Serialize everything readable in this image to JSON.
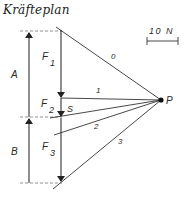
{
  "title": "Kräfteplan",
  "scale": {
    "label": "10 N"
  },
  "reactions": {
    "a_label": "A",
    "b_label": "B"
  },
  "forces": {
    "f1": {
      "base": "F",
      "sub": "1"
    },
    "f2": {
      "base": "F",
      "sub": "2"
    },
    "f3": {
      "base": "F",
      "sub": "3"
    }
  },
  "closing_line_label": "S",
  "pole_label": "P",
  "rays": [
    {
      "label": "0"
    },
    {
      "label": "1"
    },
    {
      "label": "2"
    },
    {
      "label": "3"
    }
  ],
  "colors": {
    "line": "#333333",
    "dash": "#777777",
    "text": "#2a2a2a"
  }
}
